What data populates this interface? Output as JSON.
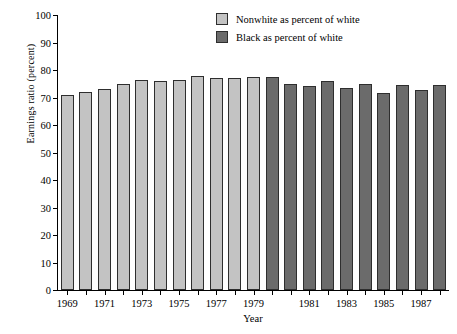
{
  "chart_data": {
    "type": "bar",
    "title": "",
    "xlabel": "Year",
    "ylabel": "Earnings ratio (percent)",
    "ylim": [
      0,
      100
    ],
    "ytick_step": 10,
    "grid": false,
    "legend_position": "top-right",
    "yticks": [
      "0",
      "10",
      "20",
      "30",
      "40",
      "50",
      "60",
      "70",
      "80",
      "90",
      "100"
    ],
    "categories": [
      "1969",
      "1970",
      "1971",
      "1972",
      "1973",
      "1974",
      "1975",
      "1976",
      "1977",
      "1978",
      "1979",
      "1979",
      "1980",
      "1981",
      "1982",
      "1983",
      "1984",
      "1985",
      "1986",
      "1987",
      "1988"
    ],
    "xtick_labels": [
      "1969",
      "1971",
      "1973",
      "1975",
      "1977",
      "1979",
      "1981",
      "1983",
      "1985",
      "1987"
    ],
    "series": [
      {
        "name": "Nonwhite as percent of white",
        "color": "#c3c3c3",
        "x": [
          "1969",
          "1970",
          "1971",
          "1972",
          "1973",
          "1974",
          "1975",
          "1976",
          "1977",
          "1978",
          "1979"
        ],
        "values": [
          71.0,
          72.0,
          73.0,
          75.0,
          76.0,
          77.0,
          76.5,
          77.0,
          78.5,
          77.5,
          77.5
        ]
      },
      {
        "name": "Black as percent of white",
        "color": "#6b6b6b",
        "x": [
          "1979",
          "1980",
          "1981",
          "1982",
          "1983",
          "1984",
          "1985",
          "1986",
          "1987",
          "1988"
        ],
        "values": [
          75.0,
          74.5,
          76.0,
          73.5,
          75.0,
          71.5,
          74.5,
          72.5,
          74.5,
          74.5
        ]
      }
    ],
    "bars": [
      {
        "index": 0,
        "label": "1969",
        "value": 71.0,
        "series": "nonwhite"
      },
      {
        "index": 1,
        "label": "1970",
        "value": 72.0,
        "series": "nonwhite"
      },
      {
        "index": 2,
        "label": "1971",
        "value": 73.0,
        "series": "nonwhite"
      },
      {
        "index": 3,
        "label": "1972",
        "value": 75.0,
        "series": "nonwhite"
      },
      {
        "index": 4,
        "label": "1973",
        "value": 76.5,
        "series": "nonwhite"
      },
      {
        "index": 5,
        "label": "1974",
        "value": 76.0,
        "series": "nonwhite"
      },
      {
        "index": 6,
        "label": "1975",
        "value": 76.2,
        "series": "nonwhite"
      },
      {
        "index": 7,
        "label": "1976",
        "value": 78.0,
        "series": "nonwhite"
      },
      {
        "index": 8,
        "label": "1977",
        "value": 77.0,
        "series": "nonwhite"
      },
      {
        "index": 9,
        "label": "1978",
        "value": 77.2,
        "series": "nonwhite"
      },
      {
        "index": 10,
        "label": "1979",
        "value": 77.5,
        "series": "nonwhite"
      },
      {
        "index": 11,
        "label": "1979",
        "value": 77.3,
        "series": "black"
      },
      {
        "index": 12,
        "label": "1980",
        "value": 75.0,
        "series": "black"
      },
      {
        "index": 13,
        "label": "1981",
        "value": 74.3,
        "series": "black"
      },
      {
        "index": 14,
        "label": "1982",
        "value": 76.0,
        "series": "black"
      },
      {
        "index": 15,
        "label": "1983",
        "value": 73.5,
        "series": "black"
      },
      {
        "index": 16,
        "label": "1984",
        "value": 75.0,
        "series": "black"
      },
      {
        "index": 17,
        "label": "1985",
        "value": 71.8,
        "series": "black"
      },
      {
        "index": 18,
        "label": "1986",
        "value": 74.5,
        "series": "black"
      },
      {
        "index": 19,
        "label": "1987",
        "value": 72.7,
        "series": "black"
      },
      {
        "index": 20,
        "label": "1988",
        "value": 74.5,
        "series": "black"
      }
    ]
  },
  "legend": {
    "items": [
      {
        "label": "Nonwhite as percent of white",
        "swatch": "light"
      },
      {
        "label": "Black as percent of white",
        "swatch": "dark"
      }
    ]
  },
  "colors": {
    "nonwhite": "#c3c3c3",
    "black": "#6b6b6b",
    "axis": "#000000",
    "background": "#ffffff"
  }
}
